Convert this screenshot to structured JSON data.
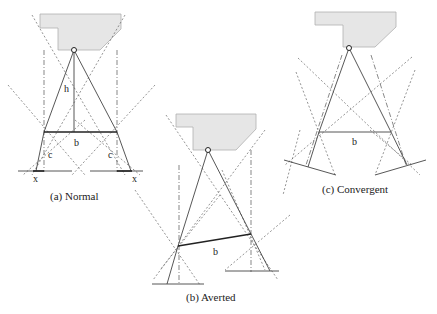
{
  "diagrams": [
    {
      "id": "a",
      "caption": "(a) Normal",
      "labels": {
        "height": "h",
        "baseline": "b",
        "left_c": "c",
        "right_c": "c",
        "left_x": "x",
        "right_x": "x"
      }
    },
    {
      "id": "b",
      "caption": "(b) Averted",
      "labels": {
        "baseline": "b"
      }
    },
    {
      "id": "c",
      "caption": "(c) Convergent",
      "labels": {
        "baseline": "b"
      }
    }
  ],
  "colors": {
    "body_fill": "#e6e6e6",
    "line": "#444444",
    "dotted": "#666666"
  }
}
